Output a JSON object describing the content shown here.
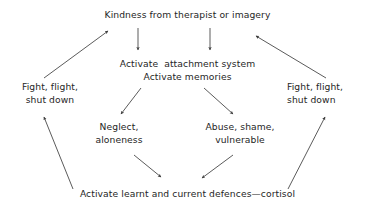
{
  "diagram": {
    "title": "Kindness from therapist or imagery",
    "background_color": "#ffffff",
    "text_color": "#262626",
    "arrow_color": "#3d3d3d",
    "nodes": {
      "kindness": {
        "id": "kindness",
        "label": "Kindness from therapist or imagery",
        "lines": [
          "Kindness from therapist or imagery"
        ]
      },
      "activate_attachment": {
        "id": "activate-attachment",
        "label": "Activate  attachment system\nActivate memories",
        "lines": [
          "Activate  attachment system",
          "Activate memories"
        ]
      },
      "fight_flight_left": {
        "id": "fight-flight-left",
        "label": "Fight, flight,\nshut down",
        "lines": [
          "Fight, flight,",
          "shut down"
        ]
      },
      "fight_flight_right": {
        "id": "fight-flight-right",
        "label": "Fight, flight,\nshut down",
        "lines": [
          "Fight, flight,",
          "shut down"
        ]
      },
      "neglect": {
        "id": "neglect",
        "label": "Neglect,\naloneness",
        "lines": [
          "Neglect,",
          "aloneness"
        ]
      },
      "abuse": {
        "id": "abuse",
        "label": "Abuse, shame,\nvulnerable",
        "lines": [
          "Abuse, shame,",
          "vulnerable"
        ]
      },
      "defences": {
        "id": "defences",
        "label": "Activate learnt and current defences—cortisol",
        "lines": [
          "Activate learnt and current defences—cortisol"
        ]
      }
    },
    "edges": [
      {
        "id": "kindness-to-attachment-left",
        "from": "kindness",
        "to": "activate_attachment",
        "direction": "down",
        "x1": 138,
        "y1": 28,
        "x2": 138,
        "y2": 50
      },
      {
        "id": "kindness-to-attachment-right",
        "from": "kindness",
        "to": "activate_attachment",
        "direction": "down",
        "x1": 210,
        "y1": 28,
        "x2": 210,
        "y2": 50
      },
      {
        "id": "fight-flight-left-to-kindness",
        "from": "fight_flight_left",
        "to": "kindness",
        "direction": "up-right",
        "x1": 44,
        "y1": 78,
        "x2": 108,
        "y2": 31
      },
      {
        "id": "fight-flight-right-to-kindness",
        "from": "fight_flight_right",
        "to": "kindness",
        "direction": "up-left",
        "x1": 326,
        "y1": 78,
        "x2": 256,
        "y2": 36
      },
      {
        "id": "attachment-to-neglect",
        "from": "activate_attachment",
        "to": "neglect",
        "direction": "down-left",
        "x1": 141,
        "y1": 88,
        "x2": 121,
        "y2": 114
      },
      {
        "id": "attachment-to-abuse",
        "from": "activate_attachment",
        "to": "abuse",
        "direction": "down-right",
        "x1": 204,
        "y1": 88,
        "x2": 233,
        "y2": 114
      },
      {
        "id": "neglect-to-defences",
        "from": "neglect",
        "to": "defences",
        "direction": "down-right",
        "x1": 134,
        "y1": 155,
        "x2": 161,
        "y2": 177
      },
      {
        "id": "abuse-to-defences",
        "from": "abuse",
        "to": "defences",
        "direction": "down-left",
        "x1": 233,
        "y1": 155,
        "x2": 202,
        "y2": 178
      },
      {
        "id": "defences-to-fight-flight-left",
        "from": "defences",
        "to": "fight_flight_left",
        "direction": "up-left",
        "x1": 73,
        "y1": 189,
        "x2": 44,
        "y2": 117
      },
      {
        "id": "defences-to-fight-flight-right",
        "from": "defences",
        "to": "fight_flight_right",
        "direction": "up-right",
        "x1": 288,
        "y1": 189,
        "x2": 325,
        "y2": 117
      }
    ]
  }
}
